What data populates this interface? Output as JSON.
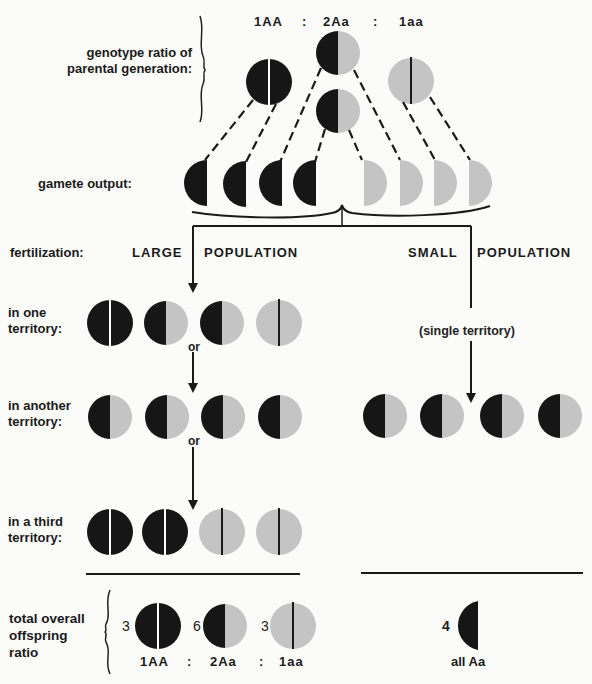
{
  "colors": {
    "dominant": "#161616",
    "recessive": "#c4c4c4",
    "line": "#1a1a1a",
    "background": "#fbfbf9"
  },
  "parental": {
    "label_line1": "genotype ratio of",
    "label_line2": "parental generation:",
    "ratio": [
      "1AA",
      ":",
      "2Aa",
      ":",
      "1aa"
    ]
  },
  "gametes": {
    "label": "gamete output:",
    "items": [
      "A",
      "A",
      "A",
      "A",
      "a",
      "a",
      "a",
      "a"
    ]
  },
  "fertilization": {
    "label": "fertilization:",
    "large_word1": "LARGE",
    "large_word2": "POPULATION",
    "small_word1": "SMALL",
    "small_word2": "POPULATION",
    "single_territory": "(single territory)",
    "or_label": "or"
  },
  "large_population": {
    "rows": [
      {
        "label_line1": "in one",
        "label_line2": "territory:",
        "genotypes": [
          "AA",
          "Aa",
          "Aa",
          "aa"
        ]
      },
      {
        "label_line1": "in another",
        "label_line2": "territory:",
        "genotypes": [
          "Aa",
          "Aa",
          "Aa",
          "Aa"
        ]
      },
      {
        "label_line1": "in a third",
        "label_line2": "territory:",
        "genotypes": [
          "AA",
          "AA",
          "aa",
          "aa"
        ]
      }
    ]
  },
  "small_population": {
    "genotypes": [
      "Aa",
      "Aa",
      "Aa",
      "Aa"
    ]
  },
  "totals": {
    "label_line1": "total overall",
    "label_line2": "offspring",
    "label_line3": "ratio",
    "large": {
      "counts": [
        "3",
        "6",
        "3"
      ],
      "genotypes": [
        "AA",
        "Aa",
        "aa"
      ],
      "ratio": [
        "1AA",
        ":",
        "2Aa",
        ":",
        "1aa"
      ]
    },
    "small": {
      "count": "4",
      "ratio": "all Aa"
    }
  }
}
